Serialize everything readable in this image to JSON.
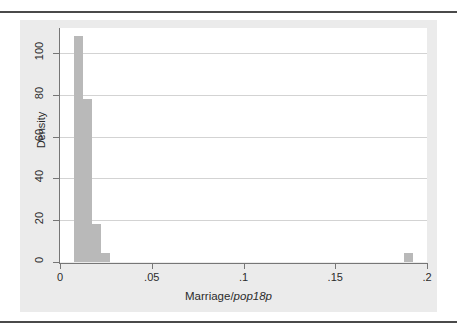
{
  "figure": {
    "background_color": "#ebebeb",
    "plot_background_color": "#ffffff",
    "bar_color": "#b9b9b9",
    "axis_color": "#767676",
    "grid_color": "#d3d3d3"
  },
  "axis_titles": {
    "y": "Density",
    "x_prefix": "Marriage/",
    "x_italic": "pop18p"
  },
  "chart_data": {
    "type": "bar",
    "title": "",
    "subtitle": "",
    "xlabel": "Marriage/pop18p",
    "ylabel": "Density",
    "xlim": [
      0,
      0.2
    ],
    "ylim": [
      0,
      112
    ],
    "grid": true,
    "legend": "none",
    "xticks": [
      0,
      0.05,
      0.1,
      0.15,
      0.2
    ],
    "xticklabels": [
      "0",
      ".05",
      ".1",
      ".15",
      ".2"
    ],
    "yticks": [
      0,
      20,
      40,
      60,
      80,
      100
    ],
    "yticklabels": [
      "0",
      "20",
      "40",
      "60",
      "80",
      "100"
    ],
    "bin_width": 0.005,
    "bars": [
      {
        "x_left": 0.0075,
        "x_right": 0.0125,
        "value": 108
      },
      {
        "x_left": 0.0125,
        "x_right": 0.0175,
        "value": 78
      },
      {
        "x_left": 0.0175,
        "x_right": 0.0225,
        "value": 18
      },
      {
        "x_left": 0.0225,
        "x_right": 0.0275,
        "value": 4.5
      },
      {
        "x_left": 0.1875,
        "x_right": 0.1925,
        "value": 4.5
      }
    ],
    "categories": [
      "0.0075-0.0125",
      "0.0125-0.0175",
      "0.0175-0.0225",
      "0.0225-0.0275",
      "0.1875-0.1925"
    ],
    "values": [
      108,
      78,
      18,
      4.5,
      4.5
    ]
  }
}
